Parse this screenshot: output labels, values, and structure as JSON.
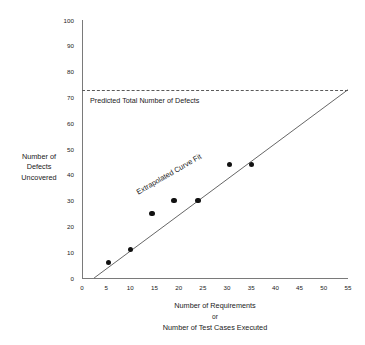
{
  "chart_data": {
    "type": "scatter",
    "title": "",
    "xlabel": "Number of Requirements or Number of Test Cases Executed",
    "ylabel": "Number of Defects Uncovered",
    "xlim": [
      0,
      55
    ],
    "ylim": [
      0,
      100
    ],
    "grid": false,
    "legend": "none",
    "x_ticks": [
      0,
      5,
      10,
      15,
      20,
      25,
      30,
      35,
      40,
      45,
      50,
      55
    ],
    "y_ticks": [
      0,
      10,
      20,
      30,
      40,
      50,
      60,
      70,
      80,
      90,
      100
    ],
    "points": [
      {
        "x": 5.5,
        "y": 6
      },
      {
        "x": 10.0,
        "y": 11
      },
      {
        "x": 14.5,
        "y": 25
      },
      {
        "x": 19.0,
        "y": 30
      },
      {
        "x": 24.0,
        "y": 30
      },
      {
        "x": 30.5,
        "y": 44
      },
      {
        "x": 35.0,
        "y": 44
      }
    ],
    "series": [
      {
        "name": "Extrapolated Curve Fit",
        "type": "line",
        "x": [
          2.5,
          55
        ],
        "values": [
          0,
          73
        ]
      }
    ],
    "annotations": [
      {
        "name": "threshold",
        "label": "Predicted Total Number of Defects",
        "y": 73,
        "style": "dashed"
      },
      {
        "name": "curve-fit",
        "label": "Extrapolated Curve Fit",
        "rotation": -30
      }
    ]
  },
  "axes": {
    "y_tick_labels": [
      "100",
      "90",
      "80",
      "70",
      "60",
      "50",
      "40",
      "30",
      "20",
      "10",
      "0"
    ],
    "x_tick_labels": [
      "0",
      "5",
      "10",
      "15",
      "20",
      "25",
      "30",
      "35",
      "40",
      "45",
      "50",
      "55"
    ],
    "y_title_lines": [
      "Number of",
      "Defects",
      "Uncovered"
    ],
    "x_title_lines": [
      "Number of Requirements",
      "or",
      "Number of Test Cases Executed"
    ]
  },
  "labels": {
    "threshold": "Predicted Total Number of Defects",
    "curve_fit": "Extrapolated Curve Fit"
  },
  "colors": {
    "axis": "#7a7a7a",
    "point": "#111111",
    "trend": "#555555",
    "threshold": "#5a5a5a",
    "text": "#1a1a1a",
    "background": "#ffffff"
  }
}
